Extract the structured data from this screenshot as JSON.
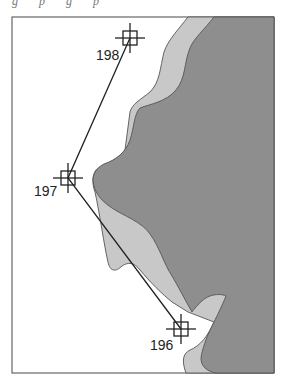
{
  "figure": {
    "caption_fragment": "g p g p",
    "frame": {
      "x": 12,
      "y": 17,
      "width": 262,
      "height": 356
    },
    "colors": {
      "water": "#ffffff",
      "shallow": "#c8c8c8",
      "land": "#8e8e8e",
      "outline": "#555555",
      "track": "#222222",
      "frame": "#666666"
    }
  },
  "waypoints": [
    {
      "id": "198",
      "label": "198",
      "x": 130,
      "y": 38,
      "label_x": 96,
      "label_y": 60
    },
    {
      "id": "197",
      "label": "197",
      "x": 68,
      "y": 178,
      "label_x": 34,
      "label_y": 196
    },
    {
      "id": "196",
      "label": "196",
      "x": 181,
      "y": 329,
      "label_x": 150,
      "label_y": 350
    }
  ],
  "track": {
    "order": [
      "198",
      "197",
      "196"
    ]
  }
}
